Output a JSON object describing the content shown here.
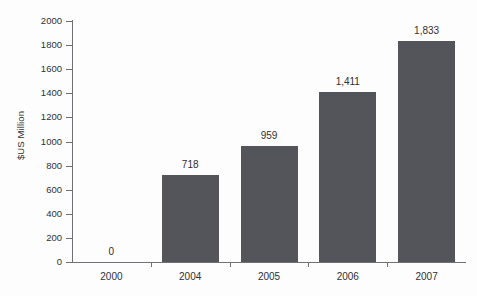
{
  "chart_data": {
    "type": "bar",
    "title": "",
    "subtitle": "",
    "xlabel": "",
    "ylabel": "$US Million",
    "categories": [
      "2000",
      "2004",
      "2005",
      "2006",
      "2007"
    ],
    "values": [
      0,
      718,
      959,
      1411,
      1833
    ],
    "value_labels": [
      "0",
      "718",
      "959",
      "1,411",
      "1,833"
    ],
    "ylim": [
      0,
      2000
    ],
    "ytick_step": 200,
    "ytick_labels": [
      "0",
      "200",
      "400",
      "600",
      "800",
      "1000",
      "1200",
      "1400",
      "1600",
      "1800",
      "2000"
    ],
    "ytick_values": [
      0,
      200,
      400,
      600,
      800,
      1000,
      1200,
      1400,
      1600,
      1800,
      2000
    ],
    "grid": false,
    "legend": false,
    "legend_position": "none",
    "series": [
      {
        "name": "$US Million",
        "values": [
          0,
          718,
          959,
          1411,
          1833
        ],
        "color": "#53555a"
      }
    ],
    "colors": {
      "bar": "#53555a",
      "axis": "#6f7175",
      "text": "#2f3033",
      "background": "#fdfdfd"
    }
  }
}
